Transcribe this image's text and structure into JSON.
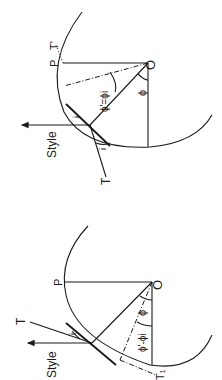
{
  "figures": [
    {
      "id": "top",
      "labels": {
        "P": "P",
        "T_prime": "T'",
        "O": "O",
        "phi": "ϕ",
        "phi_prime_eq": "ϕ'=ϕi",
        "i": "i",
        "T": "T",
        "style": "Style"
      }
    },
    {
      "id": "bottom",
      "labels": {
        "P": "P",
        "O": "O",
        "T": "T",
        "i": "i",
        "phi": "ϕ",
        "phi_prime_eq": "ϕ'-ϕi",
        "T1": "T₁",
        "style": "Style"
      }
    }
  ]
}
